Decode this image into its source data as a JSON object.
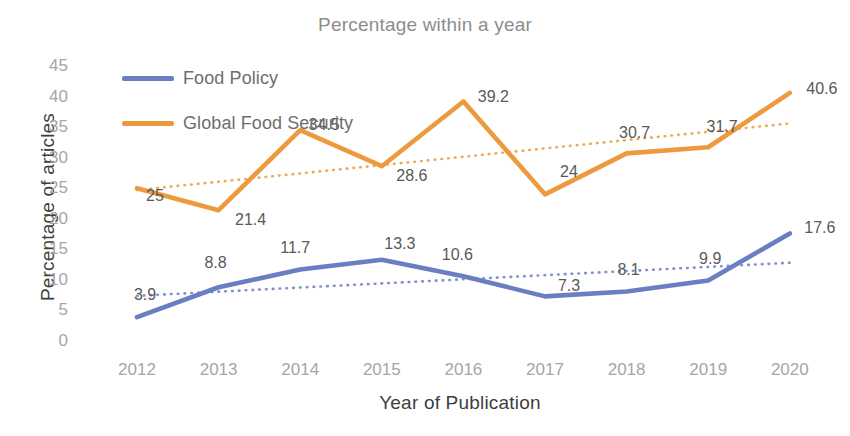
{
  "chart_data": {
    "type": "line",
    "title": "Percentage within a year",
    "xlabel": "Year of Publication",
    "ylabel": "Percentage of articles",
    "categories": [
      "2012",
      "2013",
      "2014",
      "2015",
      "2016",
      "2017",
      "2018",
      "2019",
      "2020"
    ],
    "x": [
      2012,
      2013,
      2014,
      2015,
      2016,
      2017,
      2018,
      2019,
      2020
    ],
    "ylim": [
      0,
      45
    ],
    "yticks": [
      0,
      5,
      10,
      15,
      20,
      25,
      30,
      35,
      40,
      45
    ],
    "grid": false,
    "legend_position": "top-left",
    "series": [
      {
        "name": "Food Policy",
        "color": "#6A7FC1",
        "values": [
          3.9,
          8.8,
          11.7,
          13.3,
          10.6,
          7.3,
          8.1,
          9.9,
          17.6
        ],
        "labels": [
          "3.9",
          "8.8",
          "11.7",
          "13.3",
          "10.6",
          "7.3",
          "8.1",
          "9.9",
          "17.6"
        ],
        "trendline": {
          "type": "linear-dotted",
          "start": 7.4,
          "end": 12.8,
          "color": "#6A7FC1"
        }
      },
      {
        "name": "Global Food Security",
        "color": "#ED9A3E",
        "values": [
          25,
          21.4,
          34.5,
          28.6,
          39.2,
          24,
          30.7,
          31.7,
          40.6
        ],
        "labels": [
          "25",
          "21.4",
          "34.5",
          "28.6",
          "39.2",
          "24",
          "30.7",
          "31.7",
          "40.6"
        ],
        "trendline": {
          "type": "linear-dotted",
          "start": 24.7,
          "end": 35.6,
          "color": "#ED9A3E"
        }
      }
    ]
  },
  "legend": {
    "items": [
      {
        "label": "Food Policy",
        "color": "#6A7FC1"
      },
      {
        "label": "Global Food Security",
        "color": "#ED9A3E"
      }
    ]
  },
  "colors": {
    "food_policy": "#6A7FC1",
    "global_food_security": "#ED9A3E",
    "tick_text": "#a6a6a6",
    "axis_title": "#3d3d3d",
    "chart_title": "#8d8d8d"
  },
  "label_offsets": {
    "food_policy": [
      {
        "dx": 8,
        "dy": -22
      },
      {
        "dx": -3,
        "dy": -24
      },
      {
        "dx": -5,
        "dy": -22
      },
      {
        "dx": 18,
        "dy": -16
      },
      {
        "dx": -6,
        "dy": -21
      },
      {
        "dx": 24,
        "dy": -10
      },
      {
        "dx": 2,
        "dy": -22
      },
      {
        "dx": 2,
        "dy": -22
      },
      {
        "dx": 30,
        "dy": -5
      }
    ],
    "global_food_security": [
      {
        "dx": 18,
        "dy": 8
      },
      {
        "dx": 32,
        "dy": 10
      },
      {
        "dx": 24,
        "dy": -5
      },
      {
        "dx": 30,
        "dy": 10
      },
      {
        "dx": 30,
        "dy": -4
      },
      {
        "dx": 24,
        "dy": -22
      },
      {
        "dx": 8,
        "dy": -20
      },
      {
        "dx": 14,
        "dy": -20
      },
      {
        "dx": 32,
        "dy": -4
      }
    ]
  }
}
